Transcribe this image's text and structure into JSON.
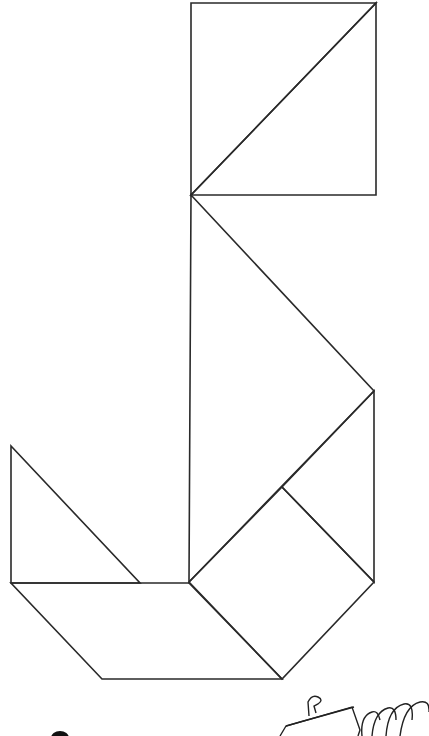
{
  "figure": {
    "stroke_color": "#2a2a2a",
    "background": "#ffffff",
    "pieces": [
      {
        "name": "large-triangle-top",
        "points": "191,3 376,3 191,195"
      },
      {
        "name": "large-triangle-top-right",
        "points": "376,3 376,195 191,195"
      },
      {
        "name": "large-triangle-middle",
        "points": "191,195 374,391 189,582"
      },
      {
        "name": "medium-triangle-right",
        "points": "374,391 374,582 282,487"
      },
      {
        "name": "square",
        "points": "282,487 374,582 282,679 189,582"
      },
      {
        "name": "small-triangle-left",
        "points": "11,446 11,583 140,583"
      },
      {
        "name": "parallelogram",
        "points": "11,583 189,583 282,679 102,679"
      }
    ]
  }
}
